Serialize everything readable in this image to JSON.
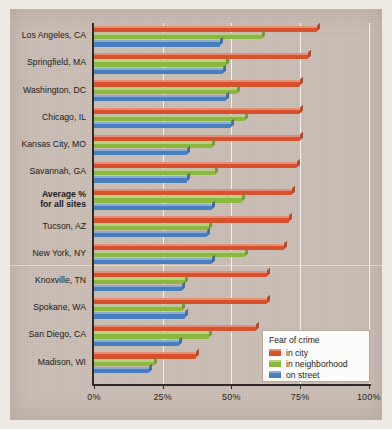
{
  "chart_data": {
    "type": "bar",
    "orientation": "horizontal",
    "title": "",
    "xlabel": "",
    "ylabel": "",
    "xlim": [
      0,
      100
    ],
    "xticks": [
      "0%",
      "25%",
      "50%",
      "75%",
      "100%"
    ],
    "xtick_values": [
      0,
      25,
      50,
      75,
      100
    ],
    "grid": true,
    "legend_position": "bottom-right",
    "legend_title": "Fear of crime",
    "categories": [
      "Los Angeles, CA",
      "Springfield, MA",
      "Washington, DC",
      "Chicago, IL",
      "Kansas City, MO",
      "Savannah, GA",
      "Average %\nfor all sites",
      "Tucson, AZ",
      "New York, NY",
      "Knoxville, TN",
      "Spokane, WA",
      "San Diego, CA",
      "Madison, WI"
    ],
    "series": [
      {
        "name": "in city",
        "color": "#d9512c",
        "values": [
          81,
          78,
          75,
          75,
          75,
          74,
          72,
          71,
          69,
          63,
          63,
          59,
          37
        ]
      },
      {
        "name": "in neighborhood",
        "color": "#8cb83f",
        "values": [
          61,
          48,
          52,
          55,
          43,
          44,
          54,
          42,
          55,
          33,
          32,
          42,
          22
        ]
      },
      {
        "name": "on street",
        "color": "#4a7fbf",
        "values": [
          46,
          47,
          48,
          50,
          34,
          34,
          43,
          41,
          43,
          32,
          33,
          31,
          20
        ]
      }
    ]
  },
  "categories_display": [
    {
      "label": "Los Angeles, CA",
      "average": false
    },
    {
      "label": "Springfield, MA",
      "average": false
    },
    {
      "label": "Washington, DC",
      "average": false
    },
    {
      "label": "Chicago, IL",
      "average": false
    },
    {
      "label": "Kansas City, MO",
      "average": false
    },
    {
      "label": "Savannah, GA",
      "average": false
    },
    {
      "label": "Average %",
      "label2": "for all sites",
      "average": true
    },
    {
      "label": "Tucson, AZ",
      "average": false
    },
    {
      "label": "New York, NY",
      "average": false
    },
    {
      "label": "Knoxville, TN",
      "average": false
    },
    {
      "label": "Spokane, WA",
      "average": false
    },
    {
      "label": "San Diego, CA",
      "average": false
    },
    {
      "label": "Madison, WI",
      "average": false
    }
  ],
  "legend": {
    "title": "Fear of crime",
    "items": [
      {
        "label": "in city",
        "color": "#d9512c",
        "icon": "legend-swatch-city"
      },
      {
        "label": "in neighborhood",
        "color": "#8cb83f",
        "icon": "legend-swatch-neighborhood"
      },
      {
        "label": "on street",
        "color": "#4a7fbf",
        "icon": "legend-swatch-street"
      }
    ]
  },
  "axis": {
    "tick_labels": [
      "0%",
      "25%",
      "50%",
      "75%",
      "100%"
    ]
  }
}
